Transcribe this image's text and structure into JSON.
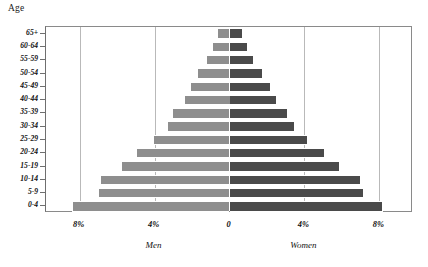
{
  "figure": {
    "age_axis_title": "Age"
  },
  "chart_data": {
    "type": "bar",
    "title": "",
    "subtitle": "",
    "xlabel": "",
    "ylabel": "Age",
    "orientation": "horizontal-diverging",
    "style": "population-pyramid",
    "grid": true,
    "legend_position": "below-axis",
    "categories": [
      "65+",
      "60-64",
      "55-59",
      "50-54",
      "45-49",
      "40-44",
      "35-39",
      "30-34",
      "25-29",
      "20-24",
      "15-19",
      "10-14",
      "5-9",
      "0-4"
    ],
    "series": [
      {
        "name": "Men",
        "side": "left",
        "color": "#8e8e8e",
        "values": [
          0.65,
          0.95,
          1.25,
          1.75,
          2.1,
          2.45,
          3.05,
          3.35,
          4.1,
          5.0,
          5.8,
          6.9,
          7.0,
          8.4
        ]
      },
      {
        "name": "Women",
        "side": "right",
        "color": "#4a4a4a",
        "values": [
          0.7,
          1.0,
          1.3,
          1.8,
          2.2,
          2.55,
          3.1,
          3.5,
          4.2,
          5.1,
          5.9,
          7.0,
          7.2,
          8.2
        ]
      }
    ],
    "xlim": [
      -9.8,
      9.8
    ],
    "x_unit": "%",
    "x_ticks": [
      {
        "value": -8,
        "label": "8%"
      },
      {
        "value": -4,
        "label": "4%"
      },
      {
        "value": 0,
        "label": "0"
      },
      {
        "value": 4,
        "label": "4%"
      },
      {
        "value": 8,
        "label": "8%"
      }
    ],
    "gridline_values": [
      -8,
      -4,
      4,
      8
    ],
    "series_axis_labels": [
      {
        "name": "Men",
        "at_value": -4
      },
      {
        "name": "Women",
        "at_value": 4
      }
    ]
  }
}
